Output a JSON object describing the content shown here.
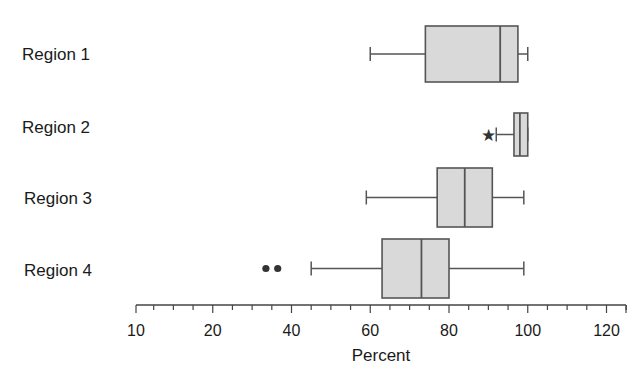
{
  "chart_data": {
    "type": "boxplot",
    "orientation": "horizontal",
    "title": "",
    "xlabel": "Percent",
    "ylabel": "",
    "xlim": [
      10,
      125
    ],
    "x_tick_labels": [
      "10",
      "20",
      "40",
      "60",
      "80",
      "100",
      "120"
    ],
    "x_tick_values": [
      0,
      20,
      40,
      60,
      80,
      100,
      120
    ],
    "minor_tick_step": 5,
    "grid": false,
    "categories": [
      "Region 1",
      "Region 2",
      "Region 3",
      "Region 4"
    ],
    "series": [
      {
        "name": "Region 1",
        "whisker_low": 60,
        "q1": 74,
        "median": 93,
        "q3": 97.5,
        "whisker_high": 100,
        "outliers": [],
        "extremes": []
      },
      {
        "name": "Region 2",
        "whisker_low": 92,
        "q1": 96.5,
        "median": 98,
        "q3": 100,
        "whisker_high": 100,
        "outliers": [],
        "extremes": [
          90
        ]
      },
      {
        "name": "Region 3",
        "whisker_low": 59,
        "q1": 77,
        "median": 84,
        "q3": 91,
        "whisker_high": 99,
        "outliers": [],
        "extremes": []
      },
      {
        "name": "Region 4",
        "whisker_low": 45,
        "q1": 63,
        "median": 73,
        "q3": 80,
        "whisker_high": 99,
        "outliers": [
          33.5,
          36.5
        ],
        "extremes": []
      }
    ],
    "colors": {
      "box_fill": "#d9d9d9",
      "stroke": "#555555",
      "marker": "#333333"
    }
  }
}
